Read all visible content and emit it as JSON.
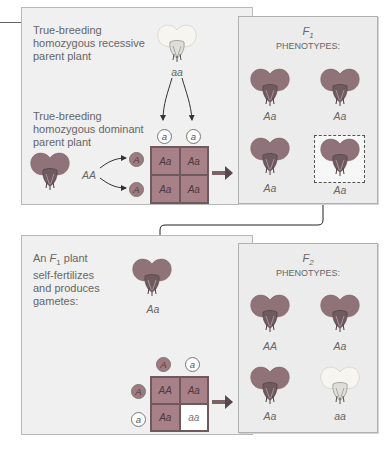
{
  "top_panel": {
    "recessive_label": [
      "True-breeding",
      "homozygous recessive",
      "parent plant"
    ],
    "recessive_genotype": "aa",
    "dominant_label": [
      "True-breeding",
      "homozygous dominant",
      "parent plant"
    ],
    "dominant_genotype": "AA",
    "column_alleles": [
      "a",
      "a"
    ],
    "row_alleles": [
      "A",
      "A"
    ],
    "punnett": [
      [
        "Aa",
        "Aa"
      ],
      [
        "Aa",
        "Aa"
      ]
    ]
  },
  "f1_panel": {
    "title_generation": "F",
    "title_subscript": "1",
    "title_text": "PHENOTYPES:",
    "plants": [
      {
        "genotype": "Aa",
        "color": "purple"
      },
      {
        "genotype": "Aa",
        "color": "purple"
      },
      {
        "genotype": "Aa",
        "color": "purple"
      },
      {
        "genotype": "Aa",
        "color": "purple",
        "highlighted": true
      }
    ]
  },
  "bottom_panel": {
    "label_prefix": "An ",
    "label_gen": "F",
    "label_sub": "1",
    "label_rest": " plant",
    "label_lines": [
      "self-fertilizes",
      "and produces",
      "gametes:"
    ],
    "parent_genotype": "Aa",
    "column_alleles": [
      "A",
      "a"
    ],
    "row_alleles": [
      "A",
      "a"
    ],
    "punnett": [
      [
        "AA",
        "Aa"
      ],
      [
        "Aa",
        "aa"
      ]
    ]
  },
  "f2_panel": {
    "title_generation": "F",
    "title_subscript": "2",
    "title_text": "PHENOTYPES:",
    "plants": [
      {
        "genotype": "AA",
        "color": "purple"
      },
      {
        "genotype": "Aa",
        "color": "purple"
      },
      {
        "genotype": "Aa",
        "color": "purple"
      },
      {
        "genotype": "aa",
        "color": "white"
      }
    ]
  },
  "colors": {
    "purple_petal": "#8f7378",
    "white_petal": "#f4f4f0",
    "punnett_fill": "#a88088",
    "panel_bg": "#f0f0f0"
  }
}
